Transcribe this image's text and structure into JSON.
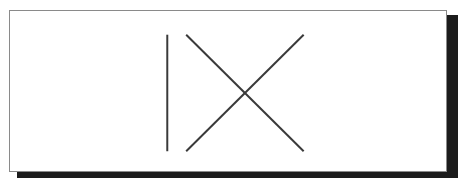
{
  "document": {
    "title": "IX",
    "background_color": "#ffffff",
    "panel": {
      "fill_color": "#ffffff",
      "border_color": "#8a8a8a",
      "shadow_color": "#1c1c1c"
    }
  },
  "drawing": {
    "name": "ix-glyph",
    "description": "Roman numeral nine drawn as a vertical stroke followed by an X",
    "stroke_color": "#3a3a3a",
    "stroke_width": 2,
    "strokes": [
      {
        "name": "vertical-stroke",
        "label": "I",
        "x1": 167,
        "y1": 34,
        "x2": 167,
        "y2": 152
      },
      {
        "name": "diagonal-stroke-down-right",
        "label": "X-backslash",
        "x1": 186,
        "y1": 34,
        "x2": 304,
        "y2": 152
      },
      {
        "name": "diagonal-stroke-up-right",
        "label": "X-slash",
        "x1": 186,
        "y1": 152,
        "x2": 304,
        "y2": 34
      }
    ],
    "intersection": {
      "x": 245,
      "y": 93
    }
  }
}
